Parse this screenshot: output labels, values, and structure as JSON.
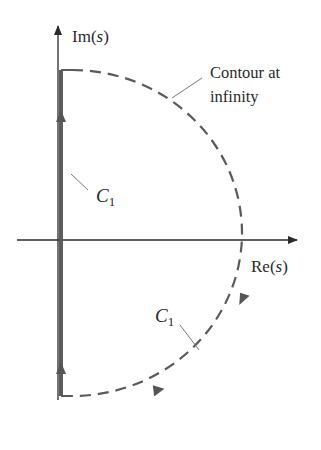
{
  "diagram": {
    "type": "nyquist-contour",
    "axes": {
      "vertical_label_prefix": "Im",
      "vertical_label_var": "s",
      "horizontal_label_prefix": "Re",
      "horizontal_label_var": "s"
    },
    "labels": {
      "contour_line1": "Contour at",
      "contour_line2": "infinity",
      "c1_upper": "C",
      "c1_upper_sub": "1",
      "c1_lower": "C",
      "c1_lower_sub": "1"
    },
    "colors": {
      "axis": "#2a2a2a",
      "contour_thick": "#5c5c5c",
      "dashed_arc": "#5a5a5a",
      "leader": "#777777"
    }
  }
}
